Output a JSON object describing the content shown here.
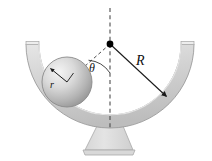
{
  "figure": {
    "name": "sphere-in-hemispherical-bowl",
    "width": 212,
    "height": 161,
    "background": "#ffffff"
  },
  "labels": {
    "radius_big": "R",
    "angle": "θ",
    "radius_small": "r"
  },
  "colors": {
    "bowl_light": "#e2e2e2",
    "bowl_mid": "#cccccc",
    "bowl_dark": "#b4b4b4",
    "bowl_outline": "#9a9a9a",
    "sphere_light": "#f0f0f0",
    "sphere_mid": "#c8c8c8",
    "sphere_dark": "#8e8e8e",
    "sphere_outline": "#8a8a8a",
    "pedestal": "#dcdcdc",
    "line": "#1a1a1a",
    "dash": "#4d4d4d",
    "pivot": "#000000"
  },
  "geometry": {
    "pivot": {
      "x": 110,
      "y": 44
    },
    "bowl": {
      "inner_radius": 71,
      "outer_radius": 84,
      "rim_y": 44
    },
    "sphere": {
      "cx": 67,
      "cy": 82,
      "radius": 25
    },
    "R_arrow_tip": {
      "x": 166,
      "y": 96
    },
    "r_arrow_tip": {
      "x": 48,
      "y": 67
    },
    "centerline": {
      "top_y": 8,
      "bottom_y": 130
    },
    "pedestal": {
      "top_y": 127,
      "top_half_width": 13,
      "bottom_y": 154,
      "bottom_half_width": 25
    }
  },
  "elements": {
    "bowl_name": "hemispherical-bowl",
    "sphere_name": "ball",
    "pivot_name": "center-of-curvature-point",
    "centerline_name": "vertical-dashed-centerline",
    "radius_line_name": "radius-to-ball-center-dashed-line",
    "R_arrow_name": "bowl-radius-arrow",
    "r_arrow_name": "ball-radius-arrow",
    "angle_arc_name": "angle-arc",
    "pedestal_name": "bowl-stand"
  }
}
